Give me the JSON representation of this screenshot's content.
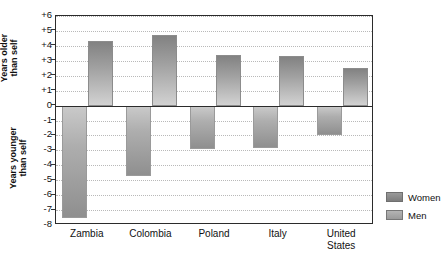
{
  "chart_data": {
    "type": "bar",
    "title": "",
    "subtitle": "",
    "xlabel": "",
    "ylabel_upper": "Years older\nthan self",
    "ylabel_lower": "Years younger\nthan self",
    "categories": [
      "Zambia",
      "Colombia",
      "Poland",
      "Italy",
      "United\nStates"
    ],
    "series": [
      {
        "name": "Women",
        "values": [
          -7.5,
          -4.7,
          -2.9,
          -2.85,
          -1.95
        ],
        "color": "#9a9a9a"
      },
      {
        "name": "Men",
        "values": [
          4.3,
          4.7,
          3.4,
          3.35,
          2.5
        ],
        "color": "#b4b4b4"
      }
    ],
    "ylim": [
      -8,
      6
    ],
    "yticks": [
      6,
      5,
      4,
      3,
      2,
      1,
      0,
      -1,
      -2,
      -3,
      -4,
      -5,
      -6,
      -7,
      -8
    ],
    "ytick_labels": [
      "+6",
      "+5",
      "+4",
      "+3",
      "+2",
      "+1",
      "0",
      "-1",
      "-2",
      "-3",
      "-4",
      "-5",
      "-6",
      "-7",
      "-8"
    ],
    "grid": true,
    "grid_style": "dotted",
    "grid_color": "#b9b9b9",
    "zero_line": 0,
    "legend_position": "right",
    "plot_border_color": "#2b2b2b",
    "background_color": "#ffffff"
  },
  "legend": {
    "items": [
      {
        "label": "Women",
        "swatch": "women"
      },
      {
        "label": "Men",
        "swatch": "men"
      }
    ]
  }
}
